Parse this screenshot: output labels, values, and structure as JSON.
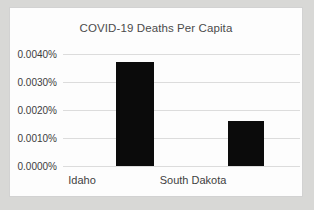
{
  "chart_data": {
    "type": "bar",
    "title": "COVID-19 Deaths Per Capita",
    "xlabel": "",
    "ylabel": "",
    "categories": [
      "Idaho",
      "South Dakota"
    ],
    "values": [
      0.0037,
      0.0016
    ],
    "value_labels": [
      "0.0037%",
      "0.0016%"
    ],
    "ytick_labels": [
      "0.0040%",
      "0.0030%",
      "0.0020%",
      "0.0010%",
      "0.0000%"
    ],
    "ytick_values": [
      0.004,
      0.003,
      0.002,
      0.001,
      0.0
    ],
    "ylim": [
      0.0,
      0.004
    ],
    "grid": true,
    "legend": false,
    "legend_position": "none",
    "bar_color": "#0b0b0b",
    "gridline_color": "#dcdcdc",
    "plot_background": "#fdfdfd",
    "frame_border_color": "#d2d2d2",
    "page_background": "#d8d8d6",
    "text_color": "#3f3f3f"
  }
}
